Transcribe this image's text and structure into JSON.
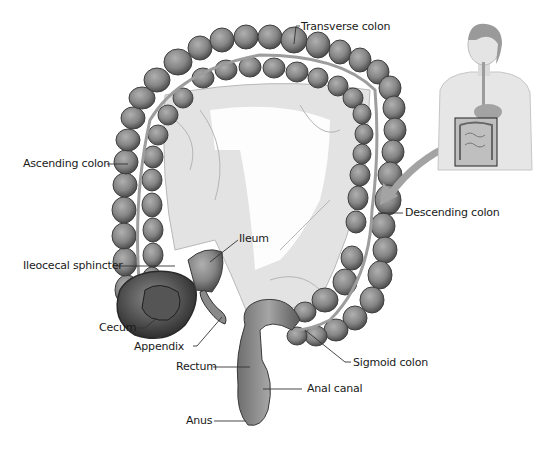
{
  "diagram": {
    "colors": {
      "background": "#ffffff",
      "colon_fill": "#8a8a8a",
      "colon_shadow": "#5a5a5a",
      "mesentery": "#dcdcdc",
      "label_text": "#1a1a1a",
      "leader_line": "#333333",
      "arrow": "#9a9a9a"
    },
    "labels": {
      "transverse_colon": "Transverse colon",
      "ascending_colon": "Ascending colon",
      "descending_colon": "Descending colon",
      "ileum": "Ileum",
      "ileocecal_sphincter": "Ileocecal sphincter",
      "cecum": "Cecum",
      "appendix": "Appendix",
      "rectum": "Rectum",
      "sigmoid_colon": "Sigmoid colon",
      "anal_canal": "Anal canal",
      "anus": "Anus"
    },
    "inset": {
      "description": "Female torso showing digestive organs with a box highlighting the large intestine region",
      "arrow_direction": "points from inset to descending colon"
    }
  }
}
